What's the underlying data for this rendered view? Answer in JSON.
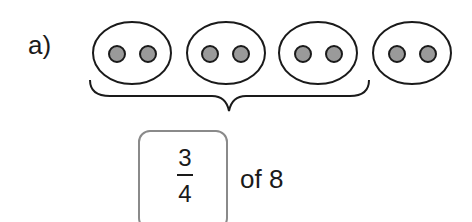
{
  "problem": {
    "label": "a)",
    "groups": [
      {
        "dots": 2
      },
      {
        "dots": 2
      },
      {
        "dots": 2
      },
      {
        "dots": 2
      }
    ],
    "braced_groups": 3,
    "fraction": {
      "numerator": "3",
      "denominator": "4"
    },
    "of_text": "of 8"
  },
  "colors": {
    "dot_fill": "#9a9a9a",
    "stroke": "#1a1a1a",
    "box_border": "#8a8a8a"
  }
}
